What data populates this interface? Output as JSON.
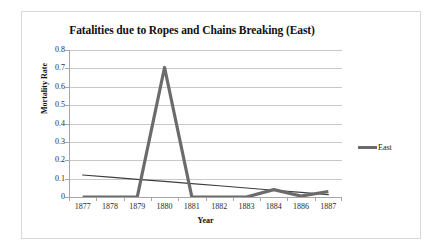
{
  "chart_data": {
    "type": "line",
    "title": "Fatalities due to Ropes and Chains Breaking (East)",
    "xlabel": "Year",
    "ylabel": "Mortality Rate",
    "categories": [
      "1877",
      "1878",
      "1879",
      "1880",
      "1881",
      "1882",
      "1883",
      "1884",
      "1886",
      "1887"
    ],
    "series": [
      {
        "name": "East",
        "values": [
          0,
          0,
          0,
          0.705,
          0,
          0,
          0,
          0.04,
          0.005,
          0.03
        ],
        "color": "#6b6b6b"
      },
      {
        "name": "Trendline",
        "values": [
          0.12,
          0.108,
          0.096,
          0.085,
          0.073,
          0.061,
          0.049,
          0.037,
          0.025,
          0.013
        ],
        "color": "#3d3d3d"
      }
    ],
    "ylim": [
      0,
      0.8
    ],
    "yticks": [
      "0.8",
      "0.7",
      "0.6",
      "0.5",
      "0.4",
      "0.3",
      "0.2",
      "0.1",
      "0"
    ],
    "ytick_values": [
      0.8,
      0.7,
      0.6,
      0.5,
      0.4,
      0.3,
      0.2,
      0.1,
      0
    ],
    "grid": true,
    "legend_position": "right",
    "legend_entries": [
      "East"
    ]
  },
  "legend": {
    "east_label": "East"
  }
}
